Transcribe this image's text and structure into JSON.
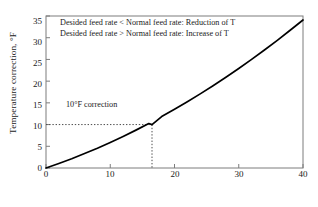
{
  "chart_data": {
    "type": "line",
    "title": "",
    "xlabel": "Percent deviation from the normal feed rate",
    "ylabel": "Temperature correction, °F",
    "xlim": [
      0,
      40
    ],
    "ylim": [
      0,
      35
    ],
    "grid": false,
    "legend": null,
    "xticks": [
      "0",
      "10",
      "20",
      "30",
      "40"
    ],
    "xtick_values": [
      0,
      10,
      20,
      30,
      40
    ],
    "yticks": [
      "0",
      "5",
      "10",
      "15",
      "20",
      "25",
      "30",
      "35"
    ],
    "ytick_values": [
      0,
      5,
      10,
      15,
      20,
      25,
      30,
      35
    ],
    "series": [
      {
        "name": "Temperature correction",
        "color": "#000000",
        "x": [
          0,
          2,
          4,
          6,
          8,
          10,
          12,
          14,
          16,
          16.5,
          18,
          20,
          22,
          24,
          26,
          28,
          30,
          32,
          34,
          36,
          38,
          40
        ],
        "y": [
          0,
          1.04,
          2.14,
          3.32,
          4.56,
          5.88,
          7.27,
          8.72,
          10.25,
          10.0,
          11.85,
          13.52,
          15.26,
          17.07,
          18.95,
          20.9,
          22.92,
          25.01,
          27.17,
          29.4,
          31.71,
          34.08
        ]
      }
    ],
    "annotations": [
      {
        "name": "note-line-1",
        "text": "Desided feed rate < Normal feed rate: Reduction of T"
      },
      {
        "name": "note-line-2",
        "text": "Desided feed rate > Normal feed rate: Increase of T"
      },
      {
        "name": "correction-callout",
        "text": "10°F correction",
        "marker_x": 16.5,
        "marker_y": 10
      }
    ],
    "guide_lines": [
      {
        "name": "horizontal-dotted-guide",
        "from": [
          0,
          10
        ],
        "to": [
          16.5,
          10
        ],
        "style": "dotted"
      },
      {
        "name": "vertical-dotted-guide",
        "from": [
          16.5,
          10
        ],
        "to": [
          16.5,
          0
        ],
        "style": "dotted"
      }
    ]
  },
  "colors": {
    "curve": "#000000",
    "frame": "#7d7d7d",
    "guide": "#4d4d4d",
    "text": "#1a1a1a",
    "background": "#ffffff"
  }
}
